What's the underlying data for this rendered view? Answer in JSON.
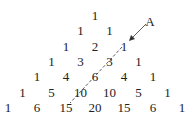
{
  "rows": [
    [
      "1"
    ],
    [
      "1",
      "1"
    ],
    [
      "1",
      "2",
      "1"
    ],
    [
      "1",
      "3",
      "3",
      "1"
    ],
    [
      "1",
      "4",
      "6",
      "4",
      "1"
    ],
    [
      "1",
      "5",
      "10",
      "10",
      "5",
      "1"
    ],
    [
      "1",
      "6",
      "15",
      "20",
      "15",
      "6",
      "1"
    ]
  ],
  "annotation": {
    "label": "A"
  },
  "colors": {
    "text": "#222222",
    "line": "#333333"
  }
}
